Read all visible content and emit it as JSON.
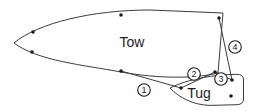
{
  "colors": {
    "ink": "#1c1c1c",
    "line_stroke": "#3c3c3c",
    "background": "#ffffff"
  },
  "labels": {
    "tow": "Tow",
    "tug": "Tug"
  },
  "diagram": {
    "type": "tug-alongside-tow-line-arrangement",
    "bitt_points": [
      [
        33,
        32
      ],
      [
        32,
        52
      ],
      [
        121,
        15
      ],
      [
        219,
        18
      ],
      [
        121,
        71
      ],
      [
        215,
        72
      ],
      [
        181,
        88
      ],
      [
        232,
        80
      ],
      [
        231,
        96
      ]
    ],
    "lines": [
      {
        "number": "1",
        "from": [
          121,
          71
        ],
        "to": [
          181,
          88
        ],
        "badge": [
          144,
          90
        ]
      },
      {
        "number": "2",
        "from": [
          181,
          88
        ],
        "to": [
          215,
          72
        ],
        "badge": [
          194,
          74
        ]
      },
      {
        "number": "3",
        "from": [
          215,
          72
        ],
        "to": [
          232,
          80
        ],
        "badge": [
          221,
          79
        ]
      },
      {
        "number": "4",
        "from": [
          219,
          18
        ],
        "to": [
          232,
          80
        ],
        "badge": [
          235,
          47
        ]
      }
    ],
    "badge_radius": 6.3,
    "dot_radius": 1.8
  }
}
